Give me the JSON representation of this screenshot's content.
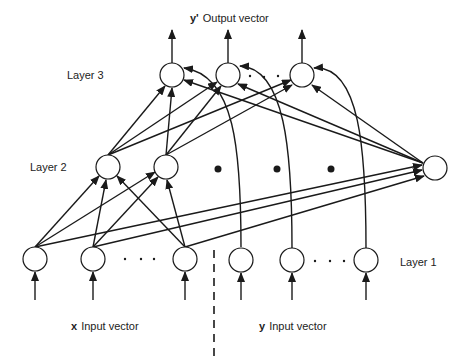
{
  "title": {
    "prefix": "y'",
    "text": "Output vector"
  },
  "labels": {
    "layer3": "Layer 3",
    "layer2": "Layer 2",
    "layer1": "Layer 1"
  },
  "inputs": {
    "x": {
      "prefix": "x",
      "text": "Input vector"
    },
    "y": {
      "prefix": "y",
      "text": "Input vector"
    }
  },
  "colors": {
    "stroke": "#1a1a1a",
    "background": "#ffffff"
  },
  "nodes": {
    "layer1": [
      {
        "x": 35,
        "y": 259
      },
      {
        "x": 93,
        "y": 259
      },
      {
        "x": 185,
        "y": 259
      },
      {
        "x": 241,
        "y": 260
      },
      {
        "x": 292,
        "y": 260
      },
      {
        "x": 366,
        "y": 260
      }
    ],
    "layer2": [
      {
        "x": 108,
        "y": 167
      },
      {
        "x": 166,
        "y": 167
      },
      {
        "x": 435,
        "y": 168
      }
    ],
    "layer3": [
      {
        "x": 172,
        "y": 75
      },
      {
        "x": 228,
        "y": 75
      },
      {
        "x": 302,
        "y": 75
      }
    ]
  },
  "ellipsis_dots": "· · ·"
}
